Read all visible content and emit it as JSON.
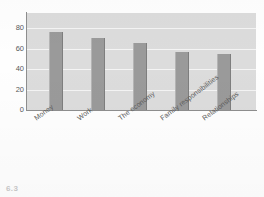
{
  "chart_data": {
    "type": "bar",
    "title": "",
    "subtitle": "",
    "xlabel": "",
    "ylabel": "",
    "categories": [
      "Money",
      "Work",
      "The economy",
      "Family responsibilities",
      "Relationships"
    ],
    "values": [
      76,
      71,
      66,
      57,
      55
    ],
    "ylim": [
      0,
      95
    ],
    "yticks": [
      0,
      20,
      40,
      60,
      80
    ],
    "ytick_labels": [
      "0",
      "20",
      "40",
      "60",
      "80"
    ],
    "grid": true,
    "grid_axis": "y",
    "legend": false,
    "legend_position": "none",
    "series": [
      {
        "name": "",
        "values": [
          76,
          71,
          66,
          57,
          55
        ]
      }
    ],
    "annotations": []
  },
  "style": {
    "plot_background": "#dcdcdc",
    "gridline_color": "#f4f4f4",
    "bar_color": "#9a9a9a",
    "axis_color": "#8e8e8e",
    "tick_label_color": "#5a5a5a",
    "page_background": "#fefefe"
  },
  "caption": {
    "text": "6.3"
  }
}
